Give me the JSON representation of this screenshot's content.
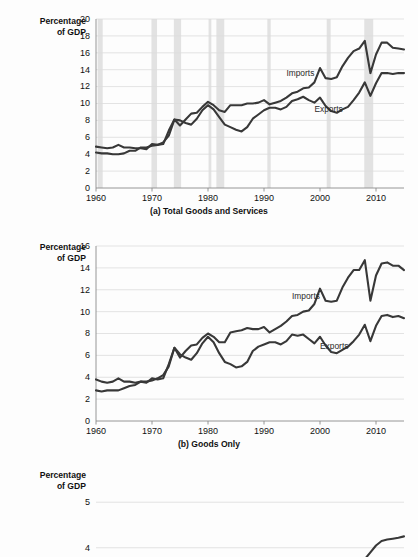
{
  "figure": {
    "y_axis_label": "Percentage\nof GDP",
    "line_color": "#383838",
    "recession_color": "#e2e2e2",
    "grid_color": "#dcdcdc"
  },
  "chart_data": [
    {
      "id": "a",
      "type": "line",
      "title": "(a) Total Goods and Services",
      "xlabel": "",
      "ylabel": "Percentage of GDP",
      "xlim": [
        1960,
        2015
      ],
      "ylim": [
        0,
        20
      ],
      "ytick_values": [
        0,
        2,
        4,
        6,
        8,
        10,
        12,
        14,
        16,
        18,
        20
      ],
      "ytick_labels": [
        "0",
        "2",
        "4",
        "6",
        "8",
        "10",
        "12",
        "14",
        "16",
        "18",
        "20"
      ],
      "xtick_values": [
        1960,
        1970,
        1980,
        1990,
        2000,
        2010
      ],
      "xtick_labels": [
        "1960",
        "1970",
        "1980",
        "1990",
        "2000",
        "2010"
      ],
      "grid": true,
      "legend": "inline-annotations",
      "annotations": [
        {
          "text": "Imports",
          "x": 1994,
          "y": 13.3
        },
        {
          "text": "Exports",
          "x": 1999,
          "y": 9.0
        }
      ],
      "recession_bands": [
        [
          1960.3,
          1961.2
        ],
        [
          1969.9,
          1970.9
        ],
        [
          1973.9,
          1975.2
        ],
        [
          1980.1,
          1980.6
        ],
        [
          1981.5,
          1982.9
        ],
        [
          1990.6,
          1991.2
        ],
        [
          2001.2,
          2001.9
        ],
        [
          2007.9,
          2009.5
        ]
      ],
      "x": [
        1960,
        1961,
        1962,
        1963,
        1964,
        1965,
        1966,
        1967,
        1968,
        1969,
        1970,
        1971,
        1972,
        1973,
        1974,
        1975,
        1976,
        1977,
        1978,
        1979,
        1980,
        1981,
        1982,
        1983,
        1984,
        1985,
        1986,
        1987,
        1988,
        1989,
        1990,
        1991,
        1992,
        1993,
        1994,
        1995,
        1996,
        1997,
        1998,
        1999,
        2000,
        2001,
        2002,
        2003,
        2004,
        2005,
        2006,
        2007,
        2008,
        2009,
        2010,
        2011,
        2012,
        2013,
        2014,
        2015
      ],
      "series": [
        {
          "name": "Imports",
          "values": [
            4.2,
            4.1,
            4.1,
            4.0,
            4.0,
            4.1,
            4.4,
            4.4,
            4.8,
            4.8,
            5.0,
            5.1,
            5.4,
            6.2,
            8.1,
            7.4,
            8.1,
            8.8,
            8.9,
            9.6,
            10.2,
            9.8,
            9.2,
            9.0,
            9.8,
            9.8,
            9.8,
            10.0,
            10.0,
            10.1,
            10.4,
            9.9,
            10.1,
            10.3,
            10.7,
            11.2,
            11.4,
            11.8,
            11.9,
            12.5,
            14.2,
            13.0,
            12.9,
            13.1,
            14.4,
            15.4,
            16.2,
            16.5,
            17.4,
            13.6,
            15.8,
            17.2,
            17.2,
            16.6,
            16.5,
            16.4
          ]
        },
        {
          "name": "Exports",
          "values": [
            4.9,
            4.8,
            4.7,
            4.8,
            5.1,
            4.8,
            4.8,
            4.7,
            4.7,
            4.6,
            5.2,
            5.1,
            5.2,
            6.8,
            8.1,
            8.0,
            7.7,
            7.5,
            8.2,
            9.2,
            9.8,
            9.3,
            8.4,
            7.5,
            7.2,
            6.9,
            6.7,
            7.2,
            8.2,
            8.7,
            9.2,
            9.5,
            9.5,
            9.3,
            9.6,
            10.3,
            10.5,
            10.8,
            10.4,
            10.1,
            10.7,
            9.7,
            9.1,
            8.9,
            9.3,
            9.6,
            10.4,
            11.3,
            12.5,
            10.9,
            12.4,
            13.6,
            13.6,
            13.5,
            13.6,
            13.6
          ]
        }
      ]
    },
    {
      "id": "b",
      "type": "line",
      "title": "(b) Goods Only",
      "xlabel": "",
      "ylabel": "Percentage of GDP",
      "xlim": [
        1960,
        2015
      ],
      "ylim": [
        0,
        16
      ],
      "ytick_values": [
        0,
        2,
        4,
        6,
        8,
        10,
        12,
        14,
        16
      ],
      "ytick_labels": [
        "0",
        "2",
        "4",
        "6",
        "8",
        "10",
        "12",
        "14",
        "16"
      ],
      "xtick_values": [
        1960,
        1970,
        1980,
        1990,
        2000,
        2010
      ],
      "xtick_labels": [
        "1960",
        "1970",
        "1980",
        "1990",
        "2000",
        "2010"
      ],
      "grid": true,
      "legend": "inline-annotations",
      "annotations": [
        {
          "text": "Imports",
          "x": 1995,
          "y": 11.2
        },
        {
          "text": "Exports",
          "x": 2000,
          "y": 6.6
        }
      ],
      "recession_bands": [],
      "x": [
        1960,
        1961,
        1962,
        1963,
        1964,
        1965,
        1966,
        1967,
        1968,
        1969,
        1970,
        1971,
        1972,
        1973,
        1974,
        1975,
        1976,
        1977,
        1978,
        1979,
        1980,
        1981,
        1982,
        1983,
        1984,
        1985,
        1986,
        1987,
        1988,
        1989,
        1990,
        1991,
        1992,
        1993,
        1994,
        1995,
        1996,
        1997,
        1998,
        1999,
        2000,
        2001,
        2002,
        2003,
        2004,
        2005,
        2006,
        2007,
        2008,
        2009,
        2010,
        2011,
        2012,
        2013,
        2014,
        2015
      ],
      "series": [
        {
          "name": "Imports",
          "values": [
            2.8,
            2.7,
            2.8,
            2.8,
            2.8,
            3.0,
            3.2,
            3.3,
            3.6,
            3.6,
            3.7,
            3.9,
            4.2,
            5.0,
            6.7,
            5.8,
            6.4,
            6.9,
            7.0,
            7.6,
            8.0,
            7.7,
            7.2,
            7.2,
            8.1,
            8.2,
            8.3,
            8.5,
            8.4,
            8.4,
            8.6,
            8.1,
            8.4,
            8.7,
            9.1,
            9.6,
            9.7,
            10.0,
            10.1,
            10.7,
            12.1,
            11.0,
            10.9,
            11.0,
            12.2,
            13.1,
            13.8,
            13.8,
            14.7,
            11.0,
            13.3,
            14.4,
            14.5,
            14.2,
            14.2,
            13.8
          ]
        },
        {
          "name": "Exports",
          "values": [
            3.8,
            3.6,
            3.5,
            3.6,
            3.9,
            3.6,
            3.6,
            3.5,
            3.6,
            3.5,
            3.9,
            3.8,
            3.9,
            5.2,
            6.7,
            6.1,
            5.8,
            5.6,
            6.2,
            7.1,
            7.7,
            7.2,
            6.2,
            5.4,
            5.2,
            4.9,
            5.0,
            5.4,
            6.4,
            6.8,
            7.0,
            7.2,
            7.2,
            7.0,
            7.3,
            7.9,
            7.8,
            7.9,
            7.5,
            7.1,
            7.7,
            6.9,
            6.3,
            6.2,
            6.5,
            6.8,
            7.3,
            7.9,
            8.8,
            7.3,
            8.7,
            9.6,
            9.7,
            9.5,
            9.6,
            9.4
          ]
        }
      ]
    },
    {
      "id": "c",
      "type": "line",
      "title": "",
      "xlabel": "",
      "ylabel": "Percentage of GDP",
      "note": "panel cropped by screenshot edge",
      "ylim": [
        3.6,
        5.4
      ],
      "ytick_values": [
        5,
        4
      ],
      "ytick_labels": [
        "5",
        "4"
      ],
      "xlim": [
        1960,
        2015
      ],
      "grid": true,
      "recession_bands": [],
      "x": [
        2004,
        2005,
        2006,
        2007,
        2008,
        2009,
        2010,
        2011,
        2012,
        2013,
        2014,
        2015
      ],
      "series": [
        {
          "name": "",
          "values": [
            3.3,
            3.35,
            3.5,
            3.45,
            3.75,
            3.9,
            4.05,
            4.15,
            4.18,
            4.2,
            4.22,
            4.25
          ]
        }
      ]
    }
  ]
}
